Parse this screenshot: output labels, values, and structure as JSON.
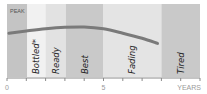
{
  "chart_data": {
    "type": "area",
    "title": "",
    "ylabel": "",
    "xlabel": "YEARS",
    "peak_label": "PEAK",
    "xlim": [
      0,
      10
    ],
    "x_ticks": [
      0,
      1,
      2,
      3,
      4,
      5,
      6,
      7,
      8,
      9,
      10
    ],
    "x_tick_labels": [
      {
        "x": 0,
        "label": "0"
      },
      {
        "x": 5,
        "label": "5"
      },
      {
        "x": 10,
        "label": "YEARS"
      }
    ],
    "bands": [
      {
        "name": "pre-release",
        "x_start": 0,
        "x_end": 1.05,
        "color": "#c4c4c4",
        "label": ""
      },
      {
        "name": "bottled",
        "x_start": 1.05,
        "x_end": 2.0,
        "color": "#f1f1f1",
        "label": "Bottled",
        "superscript": "*"
      },
      {
        "name": "ready",
        "x_start": 2.0,
        "x_end": 3.05,
        "color": "#e2e2e2",
        "label": "Ready"
      },
      {
        "name": "best",
        "x_start": 3.05,
        "x_end": 5.0,
        "color": "#c9c9c9",
        "label": "Best"
      },
      {
        "name": "fading",
        "x_start": 5.0,
        "x_end": 8.0,
        "color": "#e4e4e4",
        "label": "Fading"
      },
      {
        "name": "tired",
        "x_start": 8.0,
        "x_end": 10.0,
        "color": "#c9c9c9",
        "label": "Tired"
      }
    ],
    "series": [
      {
        "name": "quality curve",
        "color": "#7a7a7a",
        "points": [
          [
            0.1,
            0.6
          ],
          [
            1.0,
            0.63
          ],
          [
            2.0,
            0.66
          ],
          [
            3.0,
            0.68
          ],
          [
            4.0,
            0.685
          ],
          [
            5.0,
            0.66
          ],
          [
            6.0,
            0.6
          ],
          [
            7.0,
            0.53
          ],
          [
            7.8,
            0.46
          ]
        ]
      }
    ],
    "ylim": [
      0,
      1
    ],
    "grid": false,
    "legend": "none"
  }
}
